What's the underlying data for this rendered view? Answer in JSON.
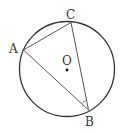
{
  "diagram": {
    "type": "circle-inscribed-triangle",
    "circle": {
      "center_label": "O",
      "cx": 67,
      "cy": 69,
      "r": 47.5
    },
    "points": {
      "A": {
        "label": "A",
        "x": 23.5,
        "y": 50
      },
      "B": {
        "label": "B",
        "x": 88.5,
        "y": 110
      },
      "C": {
        "label": "C",
        "x": 71,
        "y": 22.5
      },
      "O": {
        "label": "O",
        "x": 67,
        "y": 70
      }
    },
    "segments": [
      "AC",
      "CB",
      "AB"
    ],
    "angle_mark": {
      "vertex": "B",
      "between": [
        "A",
        "C"
      ]
    },
    "colors": {
      "stroke": "#333333",
      "background": "#ffffff"
    }
  }
}
